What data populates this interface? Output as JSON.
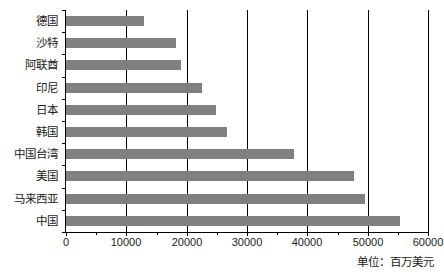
{
  "chart_data": {
    "type": "bar",
    "orientation": "horizontal",
    "title": "",
    "subtitle": "",
    "xlabel": "",
    "ylabel": "",
    "unit_note": "单位：百万美元",
    "grid": true,
    "legend": false,
    "xlim": [
      0,
      60000
    ],
    "xticks": [
      0,
      10000,
      20000,
      30000,
      40000,
      50000,
      60000
    ],
    "xtick_labels": [
      "0",
      "10000",
      "20000",
      "30000",
      "40000",
      "50000",
      "60000"
    ],
    "gridline_values": [
      10000,
      20000,
      30000,
      40000,
      50000
    ],
    "bar_color": "#808080",
    "axis_color": "#000000",
    "categories": [
      "德国",
      "沙特",
      "阿联酋",
      "印尼",
      "日本",
      "韩国",
      "中国台湾",
      "美国",
      "马来西亚",
      "中国"
    ],
    "values": [
      13000,
      18200,
      19000,
      22600,
      24800,
      26700,
      37800,
      47800,
      49500,
      55400
    ],
    "series": [
      {
        "name": "出口额",
        "values": [
          13000,
          18200,
          19000,
          22600,
          24800,
          26700,
          37800,
          47800,
          49500,
          55400
        ]
      }
    ]
  }
}
